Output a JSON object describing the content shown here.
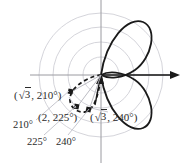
{
  "figure": {
    "type": "polar-plot",
    "colors": {
      "curve": "#1a1a1a",
      "dashed_curve": "#1a1a1a",
      "axis": "#9a9aa0",
      "grid_circle": "#c9c9d0",
      "leader_line": "#b4b4bc",
      "text": "#2b2b2b"
    },
    "axes": {
      "horizontal_arrow": true,
      "vertical_axis": true,
      "origin_x": 101,
      "origin_y": 75
    },
    "grid": {
      "circles": true,
      "circle_radii": [
        18,
        33,
        48,
        62
      ]
    }
  },
  "points": [
    {
      "id": "p210",
      "label_radius": "√3",
      "label_angle": "210°",
      "label_text": "(√3, 210°)",
      "radius_value": 1.732,
      "angle_deg": 210
    },
    {
      "id": "p225",
      "label_radius": "2",
      "label_angle": "225°",
      "label_text": "(2, 225°)",
      "radius_value": 2,
      "angle_deg": 225
    },
    {
      "id": "p240",
      "label_radius": "√3",
      "label_angle": "240°",
      "label_text": "(√3, 240°)",
      "radius_value": 1.732,
      "angle_deg": 240
    }
  ],
  "labels": {
    "point_210": {
      "open_paren": "(",
      "radical": "3",
      "comma": ", ",
      "angle": "210°",
      "close_paren": ")"
    },
    "point_225": {
      "text": "(2, 225°)"
    },
    "point_240": {
      "open_paren": "(",
      "radical": "3",
      "comma": ", ",
      "angle": "240°",
      "close_paren": ")"
    },
    "angle_210": "210°",
    "angle_225": "225°",
    "angle_240": "240°"
  }
}
